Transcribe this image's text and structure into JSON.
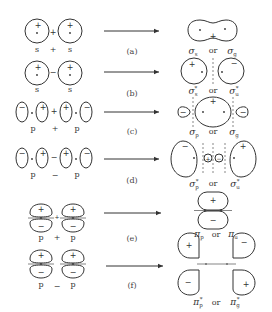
{
  "rows": [
    {
      "caption": "(a)",
      "left_labels": [
        "s",
        "+",
        "s"
      ],
      "combine_sign": "+",
      "right_labels": {
        "a": "σ",
        "a_sub": "s",
        "or": "or",
        "b": "σ",
        "b_sub": "g"
      }
    },
    {
      "caption": "(b)",
      "left_labels": [
        "s",
        "s"
      ],
      "combine_sign": "-",
      "right_labels": {
        "a": "σ",
        "a_sub": "s",
        "a_sup": "*",
        "or": "or",
        "b": "σ",
        "b_sub": "u",
        "b_sup": "*"
      }
    },
    {
      "caption": "(c)",
      "left_labels": [
        "p",
        "+",
        "p"
      ],
      "combine_sign": "+",
      "right_labels": {
        "a": "σ",
        "a_sub": "p",
        "or": "or",
        "b": "σ",
        "b_sub": "g"
      }
    },
    {
      "caption": "(d)",
      "left_labels": [
        "p",
        "−",
        "p"
      ],
      "combine_sign": "-",
      "right_labels": {
        "a": "σ",
        "a_sub": "p",
        "a_sup": "*",
        "or": "or",
        "b": "σ",
        "b_sub": "u",
        "b_sup": "*"
      }
    },
    {
      "caption": "(e)",
      "left_labels": [
        "p",
        "+",
        "p"
      ],
      "combine_sign": "+",
      "right_labels": {
        "a": "π",
        "a_sub": "p",
        "or": "or",
        "b": "π",
        "b_sub": "u"
      }
    },
    {
      "caption": "(f)",
      "left_labels": [
        "p",
        "−",
        "p"
      ],
      "combine_sign": "-",
      "right_labels": {
        "a": "π",
        "a_sub": "p",
        "a_sup": "*",
        "or": "or",
        "b": "π",
        "b_sub": "g",
        "b_sup": "*"
      }
    }
  ],
  "signs": {
    "plus": "+",
    "minus": "−"
  }
}
